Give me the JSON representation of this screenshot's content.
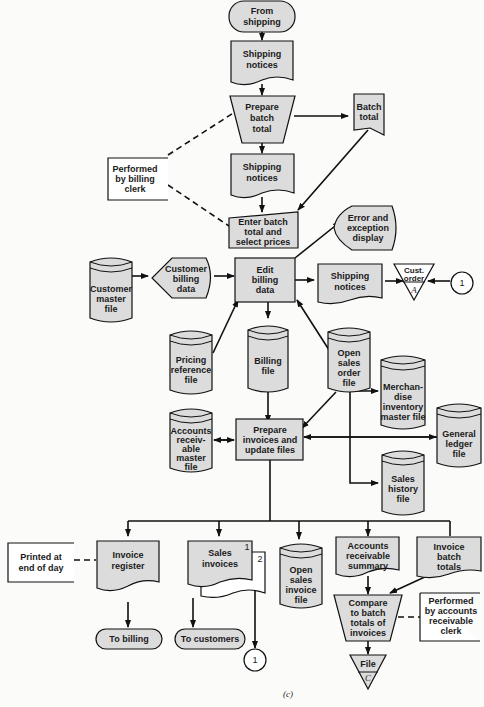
{
  "figure": {
    "caption": "(c)",
    "nodes": {
      "from_shipping": [
        "From",
        "shipping"
      ],
      "shipping_notices_1": [
        "Shipping",
        "notices"
      ],
      "prepare_batch_total": [
        "Prepare",
        "batch",
        "total"
      ],
      "batch_total": [
        "Batch",
        "total"
      ],
      "performed_billing_clerk": [
        "Performed",
        "by billing",
        "clerk"
      ],
      "shipping_notices_2": [
        "Shipping",
        "notices"
      ],
      "enter_batch_total": [
        "Enter batch",
        "total and",
        "select prices"
      ],
      "error_exception_display": [
        "Error and",
        "exception",
        "display"
      ],
      "customer_master_file": [
        "Customer",
        "master",
        "file"
      ],
      "customer_billing_data": [
        "Customer",
        "billing",
        "data"
      ],
      "edit_billing_data": [
        "Edit",
        "billing",
        "data"
      ],
      "shipping_notices_3": [
        "Shipping",
        "notices"
      ],
      "cust_order_file": [
        "Cust.",
        "order",
        "A"
      ],
      "connector_1_top": "1",
      "pricing_reference_file": [
        "Pricing",
        "reference",
        "file"
      ],
      "billing_file": [
        "Billing",
        "file"
      ],
      "open_sales_order_file": [
        "Open",
        "sales",
        "order",
        "file"
      ],
      "accounts_receivable_master_file": [
        "Accounts",
        "receiv-",
        "able",
        "master",
        "file"
      ],
      "prepare_invoices": [
        "Prepare",
        "invoices and",
        "update files"
      ],
      "merchandise_inventory_file": [
        "Merchan-",
        "dise",
        "inventory",
        "master file"
      ],
      "general_ledger_file": [
        "General",
        "ledger",
        "file"
      ],
      "sales_history_file": [
        "Sales",
        "history",
        "file"
      ],
      "printed_end_of_day": [
        "Printed at",
        "end of day"
      ],
      "invoice_register": [
        "Invoice",
        "register"
      ],
      "sales_invoices": [
        "Sales",
        "invoices"
      ],
      "sales_invoices_copy1": "1",
      "sales_invoices_copy2": "2",
      "open_sales_invoice_file": [
        "Open",
        "sales",
        "invoice",
        "file"
      ],
      "accounts_receivable_summary": [
        "Accounts",
        "receivable",
        "summary"
      ],
      "invoice_batch_totals": [
        "Invoice",
        "batch",
        "totals"
      ],
      "to_billing": "To billing",
      "to_customers": "To customers",
      "compare_batch_totals": [
        "Compare",
        "to batch",
        "totals of",
        "invoices"
      ],
      "performed_ar_clerk": [
        "Performed",
        "by accounts",
        "receivable",
        "clerk"
      ],
      "file_c": [
        "File",
        "C"
      ],
      "connector_1_bottom": "1"
    }
  }
}
